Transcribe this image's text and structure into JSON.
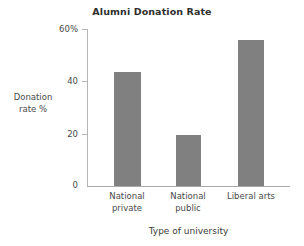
{
  "chart_data": {
    "type": "bar",
    "title": "Alumni Donation Rate",
    "categories": [
      "National private",
      "National public",
      "Liberal arts"
    ],
    "category_lines": [
      [
        "National",
        "private"
      ],
      [
        "National",
        "public"
      ],
      [
        "Liberal arts",
        ""
      ]
    ],
    "values": [
      43.5,
      19.5,
      56
    ],
    "xlabel": "Type of university",
    "ylabel": "Donation rate %",
    "ylabel_lines": [
      "Donation",
      "rate %"
    ],
    "ylim": [
      0,
      60
    ],
    "yticks": [
      0,
      20,
      40,
      60
    ],
    "ytick_labels": [
      "0",
      "20",
      "40",
      "60%"
    ],
    "grid": false,
    "legend": null,
    "bar_color": "#808080",
    "axis_color": "#b6b6b6",
    "text_color": "#4a4a4a"
  }
}
